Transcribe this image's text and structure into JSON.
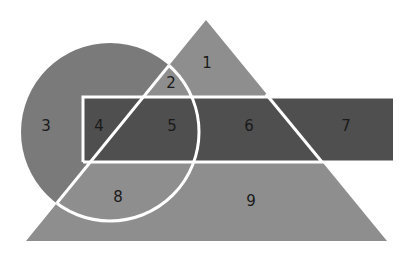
{
  "diagram": {
    "colors": {
      "background": "#ffffff",
      "triangle": "#8e8e8e",
      "circle": "#7a7a7a",
      "rectangle": "#4f4f4f",
      "outline": "#ffffff"
    },
    "regions": [
      {
        "id": "1",
        "label": "1",
        "x": 207,
        "y": 68
      },
      {
        "id": "2",
        "label": "2",
        "x": 171,
        "y": 88
      },
      {
        "id": "3",
        "label": "3",
        "x": 46,
        "y": 131
      },
      {
        "id": "4",
        "label": "4",
        "x": 99,
        "y": 131
      },
      {
        "id": "5",
        "label": "5",
        "x": 172,
        "y": 131
      },
      {
        "id": "6",
        "label": "6",
        "x": 249,
        "y": 131
      },
      {
        "id": "7",
        "label": "7",
        "x": 346,
        "y": 131
      },
      {
        "id": "8",
        "label": "8",
        "x": 118,
        "y": 202
      },
      {
        "id": "9",
        "label": "9",
        "x": 251,
        "y": 206
      }
    ]
  }
}
